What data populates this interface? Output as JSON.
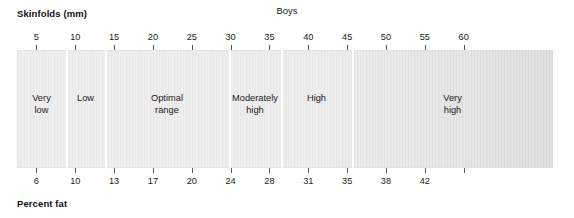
{
  "chart_data": {
    "type": "bar",
    "title": "Boys",
    "subtitle": "",
    "xlabel": "Skinfolds (mm)",
    "ylabel": "",
    "secondary_xlabel": "Percent fat",
    "orientation": "horizontal",
    "grid": false,
    "legend": "none",
    "xlim_skinfolds": [
      2.5,
      71.5
    ],
    "top_axis": {
      "name": "Skinfolds (mm)",
      "tick_values": [
        5,
        10,
        15,
        20,
        25,
        30,
        35,
        40,
        45,
        50,
        55,
        60
      ],
      "tick_labels": [
        "5",
        "10",
        "15",
        "20",
        "25",
        "30",
        "35",
        "40",
        "45",
        "50",
        "55",
        "60"
      ]
    },
    "bottom_axis": {
      "name": "Percent fat",
      "tick_values": [
        6,
        10,
        13,
        17,
        20,
        24,
        28,
        31,
        35,
        38,
        42
      ],
      "tick_labels": [
        "6",
        "10",
        "13",
        "17",
        "20",
        "24",
        "28",
        "31",
        "35",
        "38",
        "42"
      ]
    },
    "categories": [
      "Very low",
      "Low",
      "Optimal range",
      "Moderately high",
      "High",
      "Very high"
    ],
    "bands": [
      {
        "label": "Very\nlow",
        "skinfolds_range": [
          2.5,
          5
        ],
        "percent_fat_range": [
          null,
          6
        ],
        "left_pct": 0.0,
        "right_pct": 9.14
      },
      {
        "label": "Low",
        "skinfolds_range": [
          5,
          10
        ],
        "percent_fat_range": [
          6,
          10
        ],
        "left_pct": 9.14,
        "right_pct": 16.42
      },
      {
        "label": "Optimal\nrange",
        "skinfolds_range": [
          10,
          25
        ],
        "percent_fat_range": [
          10,
          20
        ],
        "left_pct": 16.42,
        "right_pct": 39.55
      },
      {
        "label": "Moderately\nhigh",
        "skinfolds_range": [
          25,
          31
        ],
        "percent_fat_range": [
          20,
          24
        ],
        "left_pct": 39.55,
        "right_pct": 49.25
      },
      {
        "label": "High",
        "skinfolds_range": [
          31,
          40
        ],
        "percent_fat_range": [
          24,
          31
        ],
        "left_pct": 49.25,
        "right_pct": 62.5
      },
      {
        "label": "Very\nhigh",
        "skinfolds_range": [
          40,
          71.5
        ],
        "percent_fat_range": [
          31,
          null
        ],
        "left_pct": 62.5,
        "right_pct": 100.0
      }
    ]
  }
}
